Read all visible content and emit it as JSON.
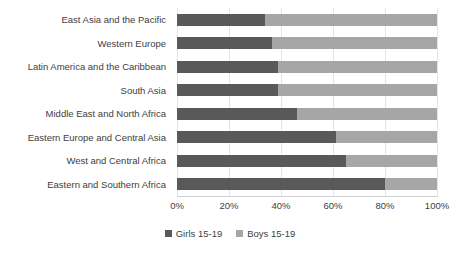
{
  "chart_data": {
    "type": "bar",
    "orientation": "horizontal",
    "stacked": true,
    "normalized": true,
    "title": "",
    "subtitle": "",
    "xlabel": "",
    "ylabel": "",
    "xlim": [
      0,
      100
    ],
    "grid": true,
    "grid_axis": "x",
    "legend_position": "bottom",
    "categories": [
      "East Asia and the Pacific",
      "Western Europe",
      "Latin America and the Caribbean",
      "South Asia",
      "Middle East and North Africa",
      "Eastern Europe and Central Asia",
      "West and Central Africa",
      "Eastern and Southern Africa"
    ],
    "xticks": [
      0,
      20,
      40,
      60,
      80,
      100
    ],
    "xticklabels": [
      "0%",
      "20%",
      "40%",
      "60%",
      "80%",
      "100%"
    ],
    "series": [
      {
        "name": "Girls 15-19",
        "color": "#595959",
        "values": [
          34,
          36.5,
          39,
          39,
          46,
          61,
          65,
          80
        ]
      },
      {
        "name": "Boys 15-19",
        "color": "#a6a6a6",
        "values": [
          66,
          63.5,
          61,
          61,
          54,
          39,
          35,
          20
        ]
      }
    ]
  },
  "legend": {
    "items": [
      {
        "label": "Girls 15-19",
        "color": "#595959"
      },
      {
        "label": "Boys 15-19",
        "color": "#a6a6a6"
      }
    ]
  }
}
